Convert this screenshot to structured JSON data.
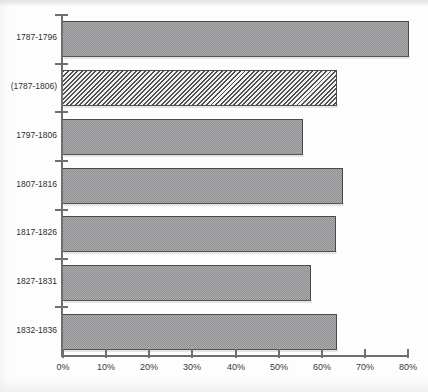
{
  "chart_data": {
    "type": "bar",
    "orientation": "horizontal",
    "title": "",
    "subtitle": "",
    "xlabel": "",
    "ylabel": "",
    "categories": [
      "1787-1796",
      "(1787-1806)",
      "1797-1806",
      "1807-1816",
      "1817-1826",
      "1827-1831",
      "1832-1836"
    ],
    "values": [
      80.5,
      63.8,
      55.9,
      65.2,
      63.6,
      57.8,
      63.8
    ],
    "value_unit": "%",
    "xlim": [
      0,
      80
    ],
    "xticks": [
      0,
      10,
      20,
      30,
      40,
      50,
      60,
      70,
      80
    ],
    "xtick_labels": [
      "0%",
      "10%",
      "20%",
      "30%",
      "40%",
      "50%",
      "60%",
      "70%",
      "80%"
    ],
    "grid": false,
    "legend": "none",
    "bar_styles": [
      "dither",
      "hatch",
      "dither",
      "dither",
      "dither",
      "dither",
      "dither"
    ],
    "colors": {
      "bar_fill": "#8d8d8f",
      "bar_border": "#4a4a4c",
      "hatch_line": "#4f4f51",
      "hatch_background": "#f2f2f2",
      "axis": "#6f6f6f",
      "text": "#2e2e30",
      "background": "#fdfdfd"
    }
  }
}
